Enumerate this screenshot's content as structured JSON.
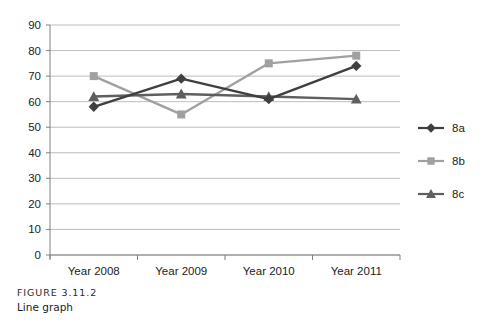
{
  "figure": {
    "caption_label": "FIGURE 3.11.2",
    "caption_title": "Line graph"
  },
  "chart_data": {
    "type": "line",
    "title": "",
    "xlabel": "",
    "ylabel": "",
    "categories": [
      "Year 2008",
      "Year 2009",
      "Year 2010",
      "Year 2011"
    ],
    "series": [
      {
        "name": "8a",
        "values": [
          58,
          69,
          61,
          74
        ],
        "color": "#3f3f3f",
        "marker": "diamond"
      },
      {
        "name": "8b",
        "values": [
          70,
          55,
          75,
          78
        ],
        "color": "#a0a0a0",
        "marker": "square"
      },
      {
        "name": "8c",
        "values": [
          62,
          63,
          62,
          61
        ],
        "color": "#5f5f5f",
        "marker": "triangle"
      }
    ],
    "ylim": [
      0,
      90
    ],
    "yticks": [
      0,
      10,
      20,
      30,
      40,
      50,
      60,
      70,
      80,
      90
    ],
    "ytick_labels": [
      "0",
      "10",
      "20",
      "30",
      "40",
      "50",
      "60",
      "70",
      "80",
      "90"
    ],
    "grid": true,
    "grid_axis": "y",
    "legend_position": "right",
    "axis_color": "#808080",
    "grid_color": "#b5b5b5",
    "background": "#ffffff"
  }
}
